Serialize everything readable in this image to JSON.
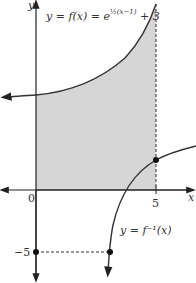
{
  "figure": {
    "axes": {
      "x_label": "x",
      "y_label": "y",
      "origin_label": "0",
      "x_tick_label": "5",
      "y_tick_label": "−5"
    },
    "curves": {
      "f_label_prefix": "y = f(x) = e",
      "f_label_exponent": "½(x−1)",
      "f_label_suffix": " + 3",
      "finv_label": "y = f⁻¹(x)"
    },
    "colors": {
      "shade": "#d6d6d6",
      "curve": "#333333",
      "axis": "#222222"
    }
  }
}
